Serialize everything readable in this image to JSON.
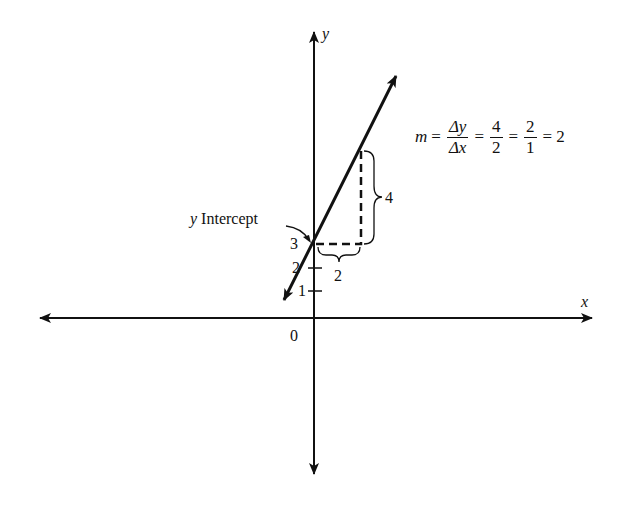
{
  "diagram": {
    "type": "slope-intercept-graph",
    "axes": {
      "x_label": "x",
      "y_label": "y",
      "origin_label": "0",
      "y_ticks": [
        "1",
        "2",
        "3"
      ]
    },
    "line": {
      "y_intercept": 3,
      "slope": 2,
      "intercept_label_var": "y",
      "intercept_label_text": " Intercept"
    },
    "rise_run": {
      "rise_label": "4",
      "run_label": "2"
    },
    "formula": {
      "lhs": "m",
      "eq": "=",
      "frac1_num": "Δy",
      "frac1_den": "Δx",
      "frac2_num": "4",
      "frac2_den": "2",
      "frac3_num": "2",
      "frac3_den": "1",
      "result": "2"
    },
    "colors": {
      "stroke": "#111111",
      "background": "#ffffff"
    }
  }
}
